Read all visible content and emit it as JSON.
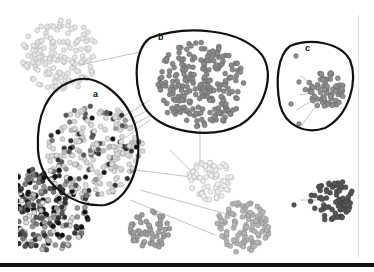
{
  "figure": {
    "type": "network-graph-clusters",
    "labels": {
      "a": "a",
      "b": "b",
      "c": "c"
    },
    "clusters": [
      {
        "id": "top-left",
        "cx": 60,
        "cy": 55,
        "r": 38,
        "fill": "#e6e6e6",
        "stroke": "#999",
        "count": 160
      },
      {
        "id": "a",
        "cx": 95,
        "cy": 150,
        "r": 48,
        "fill": "#cfcfcf",
        "stroke": "#888",
        "count": 220,
        "outlined": true
      },
      {
        "id": "b",
        "cx": 200,
        "cy": 85,
        "r": 45,
        "fill": "#8a8a8a",
        "stroke": "#555",
        "count": 240,
        "outlined": true
      },
      {
        "id": "c",
        "cx": 325,
        "cy": 90,
        "r": 20,
        "fill": "#8f8f8f",
        "stroke": "#555",
        "count": 70,
        "outlined": true
      },
      {
        "id": "left-dense",
        "cx": 45,
        "cy": 210,
        "r": 45,
        "fill": "#7a7a7a",
        "stroke": "#444",
        "count": 260
      },
      {
        "id": "mid-light",
        "cx": 210,
        "cy": 180,
        "r": 22,
        "fill": "#eeeeee",
        "stroke": "#999",
        "count": 70
      },
      {
        "id": "mid-bottom",
        "cx": 242,
        "cy": 226,
        "r": 28,
        "fill": "#b5b5b5",
        "stroke": "#777",
        "count": 110
      },
      {
        "id": "right-dark",
        "cx": 332,
        "cy": 200,
        "r": 22,
        "fill": "#555555",
        "stroke": "#333",
        "count": 75
      },
      {
        "id": "bottom-mid",
        "cx": 150,
        "cy": 230,
        "r": 20,
        "fill": "#a0a0a0",
        "stroke": "#666",
        "count": 60
      }
    ],
    "colors": {
      "outline": "#111111",
      "rule": "#111111",
      "edge": "#9a9a9a"
    }
  }
}
